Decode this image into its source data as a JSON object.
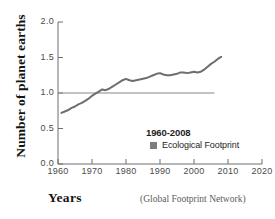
{
  "chart_data": {
    "type": "line",
    "title": "",
    "xlabel": "Years",
    "ylabel": "Number of planet earths",
    "source_note": "(Global Footprint Network)",
    "xlim": [
      1960,
      2020
    ],
    "ylim": [
      0.0,
      2.0
    ],
    "grid": false,
    "xticks": [
      1960,
      1970,
      1980,
      1990,
      2000,
      2010,
      2020
    ],
    "xtick_labels": [
      "1960",
      "1970",
      "1980",
      "1990",
      "2000",
      "2010",
      "2020"
    ],
    "yticks": [
      0.0,
      0.5,
      1.0,
      1.5,
      2.0
    ],
    "ytick_labels": [
      "0.0",
      "0.5",
      "1.0",
      "1.5",
      "2.0"
    ],
    "legend": {
      "position": "inside-lower-right",
      "title": "1960-2008",
      "entries": [
        {
          "label": "Ecological Footprint",
          "marker": "square",
          "color": "#7d7d7d"
        }
      ]
    },
    "reference_line": {
      "label": "one planet earth",
      "y": 1.0,
      "x_start": 1960,
      "x_end": 2006,
      "color": "#888888"
    },
    "series": [
      {
        "name": "Ecological Footprint",
        "color": "#6e6e6e",
        "x": [
          1961,
          1962,
          1963,
          1964,
          1965,
          1966,
          1967,
          1968,
          1969,
          1970,
          1971,
          1972,
          1973,
          1974,
          1975,
          1976,
          1977,
          1978,
          1979,
          1980,
          1981,
          1982,
          1983,
          1984,
          1985,
          1986,
          1987,
          1988,
          1989,
          1990,
          1991,
          1992,
          1993,
          1994,
          1995,
          1996,
          1997,
          1998,
          1999,
          2000,
          2001,
          2002,
          2003,
          2004,
          2005,
          2006,
          2007,
          2008
        ],
        "values": [
          0.72,
          0.74,
          0.76,
          0.79,
          0.81,
          0.84,
          0.86,
          0.89,
          0.92,
          0.96,
          0.99,
          1.02,
          1.05,
          1.04,
          1.06,
          1.09,
          1.12,
          1.15,
          1.18,
          1.2,
          1.18,
          1.17,
          1.18,
          1.19,
          1.2,
          1.21,
          1.23,
          1.25,
          1.27,
          1.28,
          1.26,
          1.25,
          1.25,
          1.26,
          1.27,
          1.29,
          1.29,
          1.28,
          1.29,
          1.3,
          1.29,
          1.3,
          1.33,
          1.37,
          1.41,
          1.44,
          1.48,
          1.51
        ]
      }
    ]
  }
}
